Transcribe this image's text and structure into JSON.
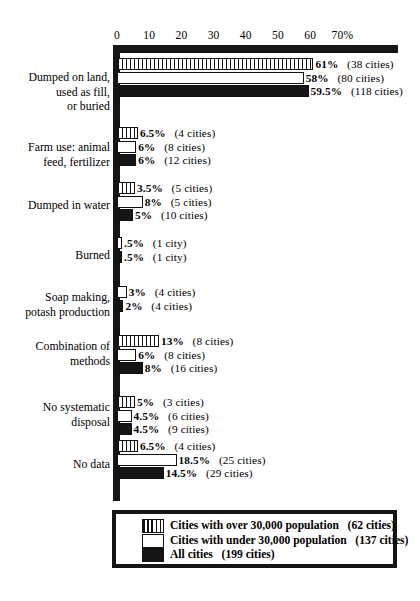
{
  "chart_data": {
    "type": "bar",
    "orientation": "horizontal",
    "title": "",
    "subtitle": "",
    "xlabel": "",
    "ylabel": "",
    "xlim": [
      0,
      89
    ],
    "grid": false,
    "legend_position": "bottom",
    "axis": {
      "ticks": [
        {
          "label": "0",
          "value": 0
        },
        {
          "label": "10",
          "value": 10
        },
        {
          "label": "20",
          "value": 20
        },
        {
          "label": "30",
          "value": 30
        },
        {
          "label": "40",
          "value": 40
        },
        {
          "label": "50",
          "value": 50
        },
        {
          "label": "60",
          "value": 60
        },
        {
          "label": "70%",
          "value": 70
        }
      ]
    },
    "categories": [
      "Dumped on land,\nused as fill,\nor buried",
      "Farm use: animal\nfeed, fertilizer",
      "Dumped in water",
      "Burned",
      "Soap making,\npotash production",
      "Combination of\nmethods",
      "No systematic\ndisposal",
      "No data"
    ],
    "series": [
      {
        "name": "Cities with over 30,000 population",
        "style": "hatch",
        "total_cities": 62,
        "values": [
          61,
          6.5,
          3.5,
          null,
          null,
          13,
          5,
          6.5
        ],
        "labels": [
          "61%",
          "6.5%",
          "3.5%",
          null,
          null,
          "13%",
          "5%",
          "6.5%"
        ],
        "counts": [
          "(38 cities)",
          "(4 cities)",
          "(5 cities)",
          null,
          null,
          "(8 cities)",
          "(3 cities)",
          "(4 cities)"
        ]
      },
      {
        "name": "Cities with under 30,000 population",
        "style": "white",
        "total_cities": 137,
        "values": [
          58,
          6,
          8,
          0.5,
          3,
          6,
          4.5,
          18.5
        ],
        "labels": [
          "58%",
          "6%",
          "8%",
          ".5%",
          "3%",
          "6%",
          "4.5%",
          "18.5%"
        ],
        "counts": [
          "(80 cities)",
          "(8 cities)",
          "(5 cities)",
          "(1 city)",
          "(4 cities)",
          "(8 cities)",
          "(6 cities)",
          "(25 cities)"
        ]
      },
      {
        "name": "All cities",
        "style": "black",
        "total_cities": 199,
        "values": [
          59.5,
          6,
          5,
          0.5,
          2,
          8,
          4.5,
          14.5
        ],
        "labels": [
          "59.5%",
          "6%",
          "5%",
          ".5%",
          "2%",
          "8%",
          "4.5%",
          "14.5%"
        ],
        "counts": [
          "(118 cities)",
          "(12 cities)",
          "(10 cities)",
          "(1 city)",
          "(4 cities)",
          "(16 cities)",
          "(9 cities)",
          "(29 cities)"
        ]
      }
    ]
  },
  "legend": {
    "entries": [
      {
        "style": "hatch",
        "label": "Cities with over 30,000 population",
        "count": "(62 cities)"
      },
      {
        "style": "white",
        "label": "Cities with under 30,000 population",
        "count": "(137 cities)"
      },
      {
        "style": "black",
        "label": "All cities",
        "count": "(199 cities)"
      }
    ]
  },
  "colors": {
    "ink": "#151515",
    "background": "#ffffff"
  }
}
